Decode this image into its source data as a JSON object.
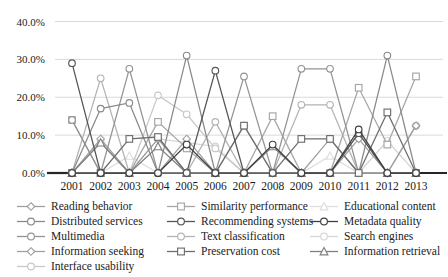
{
  "figure": {
    "background": "#ffffff",
    "axis_color": "#262626",
    "grid_color": "#d9d9d9",
    "tick_label_color": "#1a1a1a"
  },
  "chart_data": {
    "type": "line",
    "title": "",
    "xlabel": "",
    "ylabel": "",
    "x": [
      "2001",
      "2002",
      "2003",
      "2004",
      "2005",
      "2006",
      "2007",
      "2008",
      "2009",
      "2010",
      "2011",
      "2012",
      "2013"
    ],
    "ylim": [
      0,
      40
    ],
    "y_ticks": [
      0,
      10,
      20,
      30,
      40
    ],
    "y_tick_labels": [
      "0.0%",
      "10.0%",
      "20.0%",
      "30.0%",
      "40.0%"
    ],
    "grid": "horizontal",
    "legend_position": "bottom",
    "legend_columns": 3,
    "series": [
      {
        "name": "Reading behavior",
        "marker": "diamond",
        "color": "#9e9e9e",
        "values": [
          0,
          0,
          0,
          9,
          0,
          0,
          12.5,
          0,
          0,
          0,
          9,
          0,
          12.5
        ]
      },
      {
        "name": "Similarity performance",
        "marker": "square",
        "color": "#a6a6a6",
        "values": [
          14,
          0,
          0,
          13.5,
          6.5,
          0,
          0,
          15,
          0,
          0,
          22.5,
          7.5,
          25.5
        ]
      },
      {
        "name": "Educational content",
        "marker": "triangle",
        "color": "#dedede",
        "values": [
          0,
          0,
          4.5,
          0,
          0,
          0,
          0,
          0,
          0,
          4.5,
          0,
          0,
          0
        ]
      },
      {
        "name": "Distributed services",
        "marker": "circle",
        "color": "#8a8a8a",
        "values": [
          0,
          17,
          18.5,
          0,
          31,
          0,
          0,
          0,
          0,
          0,
          0,
          31,
          0
        ]
      },
      {
        "name": "Recommending systems",
        "marker": "circle",
        "color": "#565656",
        "values": [
          29,
          0,
          0,
          0,
          0,
          27,
          0,
          0,
          0,
          0,
          10.5,
          0,
          0
        ]
      },
      {
        "name": "Metadata quality",
        "marker": "circle",
        "color": "#404040",
        "values": [
          0,
          0,
          0,
          0,
          7.5,
          0,
          0,
          7.5,
          0,
          0,
          11.5,
          0,
          0
        ]
      },
      {
        "name": "Multimedia",
        "marker": "circle",
        "color": "#949494",
        "values": [
          14,
          0,
          27.5,
          0,
          0,
          0,
          25.5,
          0,
          27.5,
          27.5,
          0,
          0,
          0
        ]
      },
      {
        "name": "Text classification",
        "marker": "circle",
        "color": "#b3b3b3",
        "values": [
          0,
          25,
          0,
          0,
          0,
          13.5,
          0,
          0,
          18,
          18,
          0,
          0,
          12.5
        ]
      },
      {
        "name": "Search engines",
        "marker": "circle",
        "color": "#d6d6d6",
        "values": [
          0,
          8.5,
          0,
          9,
          8,
          7,
          0,
          0,
          0,
          0,
          0,
          8.5,
          0
        ]
      },
      {
        "name": "Information seeking",
        "marker": "diamond",
        "color": "#a0a0a0",
        "values": [
          0,
          9,
          0,
          0,
          9,
          0,
          0,
          0,
          0,
          9,
          0,
          0,
          0
        ]
      },
      {
        "name": "Preservation cost",
        "marker": "square",
        "color": "#6e6e6e",
        "values": [
          0,
          0,
          9,
          9.5,
          0,
          0,
          12.5,
          0,
          9,
          9,
          0,
          16,
          0
        ]
      },
      {
        "name": "Information retrieval",
        "marker": "triangle",
        "color": "#808080",
        "values": [
          0,
          8,
          0,
          7,
          0,
          0,
          0,
          7,
          0,
          0,
          10.5,
          0,
          0
        ]
      },
      {
        "name": "Interface usability",
        "marker": "circle",
        "color": "#c8c8c8",
        "values": [
          0,
          0,
          0,
          20.5,
          15.5,
          6.5,
          0,
          0,
          0,
          0,
          0,
          0,
          0
        ]
      }
    ]
  }
}
